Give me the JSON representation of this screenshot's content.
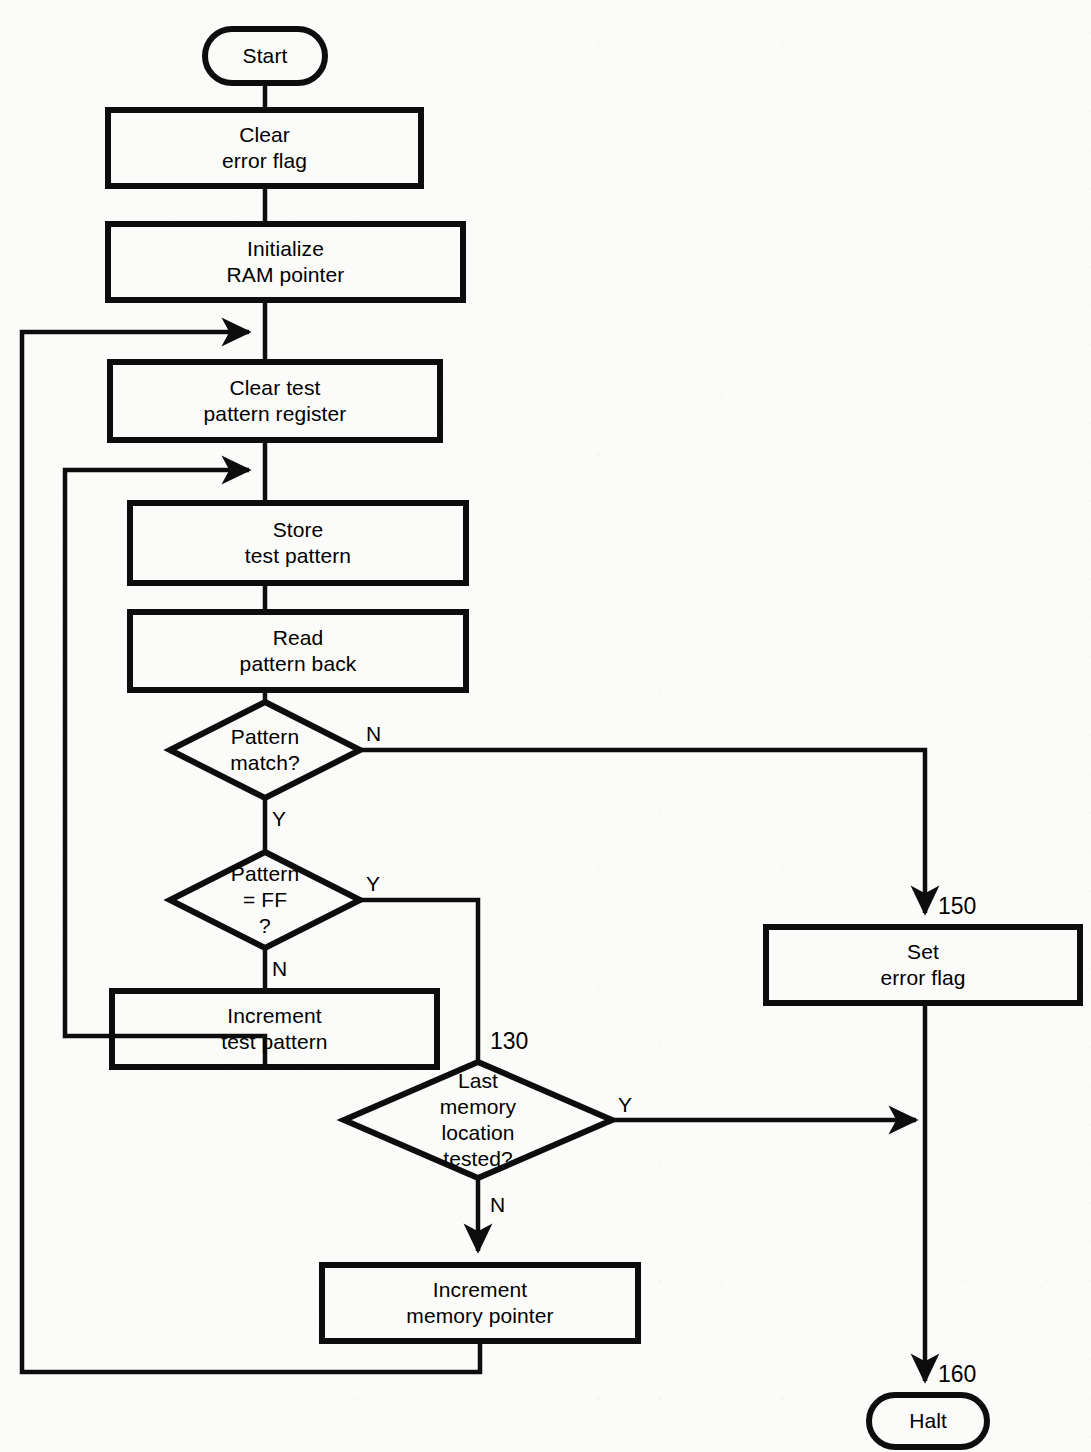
{
  "diagram": {
    "type": "flowchart",
    "colors": {
      "stroke": "#0d0d0d",
      "fill": "#fbfbfa",
      "background": "#fbfbfa",
      "text": "#000000"
    },
    "nodes": [
      {
        "id": "start",
        "shape": "terminator",
        "line1": "Start",
        "line2": "",
        "line3": "",
        "line4": ""
      },
      {
        "id": "clear-error-flag",
        "shape": "process",
        "line1": "Clear",
        "line2": "error flag",
        "line3": "",
        "line4": ""
      },
      {
        "id": "init-ram-pointer",
        "shape": "process",
        "line1": "Initialize",
        "line2": "RAM pointer",
        "line3": "",
        "line4": ""
      },
      {
        "id": "clear-test-pattern-register",
        "shape": "process",
        "line1": "Clear test",
        "line2": "pattern register",
        "line3": "",
        "line4": ""
      },
      {
        "id": "store-test-pattern",
        "shape": "process",
        "line1": "Store",
        "line2": "test pattern",
        "line3": "",
        "line4": ""
      },
      {
        "id": "read-pattern-back",
        "shape": "process",
        "line1": "Read",
        "line2": "pattern back",
        "line3": "",
        "line4": ""
      },
      {
        "id": "pattern-match",
        "shape": "decision",
        "line1": "Pattern",
        "line2": "match?",
        "line3": "",
        "line4": ""
      },
      {
        "id": "pattern-equals-ff",
        "shape": "decision",
        "line1": "Pattern",
        "line2": "= FF",
        "line3": "?",
        "line4": ""
      },
      {
        "id": "increment-test-pattern",
        "shape": "process",
        "line1": "Increment",
        "line2": "test pattern",
        "line3": "",
        "line4": ""
      },
      {
        "id": "last-memory-location-tested",
        "shape": "decision",
        "line1": "Last",
        "line2": "memory",
        "line3": "location",
        "line4": "tested?"
      },
      {
        "id": "increment-memory-pointer",
        "shape": "process",
        "line1": "Increment",
        "line2": "memory pointer",
        "line3": "",
        "line4": ""
      },
      {
        "id": "set-error-flag",
        "shape": "process",
        "line1": "Set",
        "line2": "error flag",
        "line3": "",
        "line4": ""
      },
      {
        "id": "halt",
        "shape": "terminator",
        "line1": "Halt",
        "line2": "",
        "line3": "",
        "line4": ""
      }
    ],
    "edge_labels": [
      {
        "id": "pattern-match-no",
        "text": "N"
      },
      {
        "id": "pattern-match-yes",
        "text": "Y"
      },
      {
        "id": "pattern-ff-yes",
        "text": "Y"
      },
      {
        "id": "pattern-ff-no",
        "text": "N"
      },
      {
        "id": "last-memory-yes",
        "text": "Y"
      },
      {
        "id": "last-memory-no",
        "text": "N"
      }
    ],
    "line_numbers": [
      {
        "id": "line-number-130",
        "text": "130"
      },
      {
        "id": "line-number-150",
        "text": "150"
      },
      {
        "id": "line-number-160",
        "text": "160"
      }
    ]
  }
}
